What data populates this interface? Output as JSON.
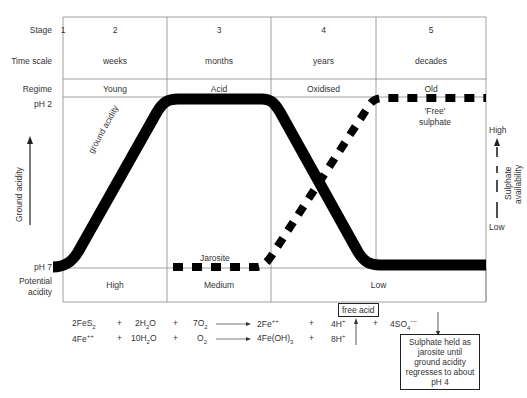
{
  "rows": {
    "stage_label": "Stage",
    "time_scale_label": "Time scale",
    "regime_label": "Regime",
    "ph2_label": "pH 2",
    "ph7_label": "pH 7",
    "potential_acidity_label_1": "Potential",
    "potential_acidity_label_2": "acidity"
  },
  "stages": [
    {
      "num": "1",
      "time": "",
      "regime": ""
    },
    {
      "num": "2",
      "time": "weeks",
      "regime": "Young",
      "potential": "High"
    },
    {
      "num": "3",
      "time": "months",
      "regime": "Acid",
      "potential": "Medium"
    },
    {
      "num": "4",
      "time": "years",
      "regime": "Oxidised"
    },
    {
      "num": "5",
      "time": "decades",
      "regime": "Old"
    }
  ],
  "potential_low": "Low",
  "curves": {
    "ground_acidity_label": "ground acidity",
    "jarosite_label": "Jarosite",
    "free_sulphate_label_1": "'Free'",
    "free_sulphate_label_2": "sulphate"
  },
  "left_axis": {
    "label": "Ground  acidity"
  },
  "right_axis": {
    "high": "High",
    "low": "Low",
    "label_1": "Sulphate",
    "label_2": "availability"
  },
  "equations": {
    "row1": {
      "a": "2FeS",
      "a_sub": "2",
      "plus1": "+",
      "b": "2H",
      "b_sub": "2",
      "b_end": "O",
      "plus2": "+",
      "c": "7O",
      "c_sub": "2",
      "d": "2Fe",
      "d_sup": "++",
      "plus3": "+",
      "e": "4H",
      "e_sup": "+",
      "plus4": "+",
      "f": "4SO",
      "f_sub": "4",
      "f_sup": "−−"
    },
    "row2": {
      "a": "4Fe",
      "a_sup": "++",
      "plus1": "+",
      "b": "10H",
      "b_sub": "2",
      "b_end": "O",
      "plus2": "+",
      "c": "O",
      "c_sub": "2",
      "d": "4Fe(OH)",
      "d_sub": "3",
      "plus3": "+",
      "e": "8H",
      "e_sup": "+"
    }
  },
  "free_acid_label": "free acid",
  "note_box": {
    "lines": [
      "Sulphate held as",
      "jarosite until",
      "ground acidity",
      "regresses to about",
      "pH 4"
    ]
  }
}
